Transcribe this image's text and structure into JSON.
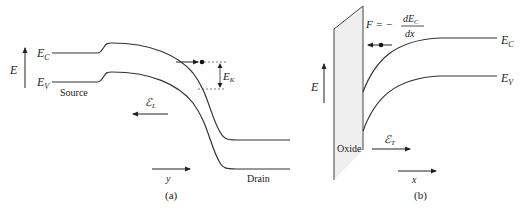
{
  "panel_a": {
    "caption": "(a)",
    "axis_energy_label": "E",
    "ec_label": "E",
    "ec_sub": "C",
    "ev_label": "E",
    "ev_sub": "V",
    "source_label": "Source",
    "drain_label": "Drain",
    "field_label": "ℰ",
    "field_sub": "L",
    "ek_label": "E",
    "ek_sub": "K",
    "y_axis_label": "y"
  },
  "panel_b": {
    "caption": "(b)",
    "axis_energy_label": "E",
    "force_lhs": "F = −",
    "force_num": "dE",
    "force_num_sub": "C",
    "force_den": "dx",
    "ec_label": "E",
    "ec_sub": "C",
    "ev_label": "E",
    "ev_sub": "V",
    "oxide_label": "Oxide",
    "field_label": "ℰ",
    "field_sub": "T",
    "x_axis_label": "x"
  },
  "colors": {
    "line": "#333333",
    "oxide_fill": "#efefef"
  }
}
